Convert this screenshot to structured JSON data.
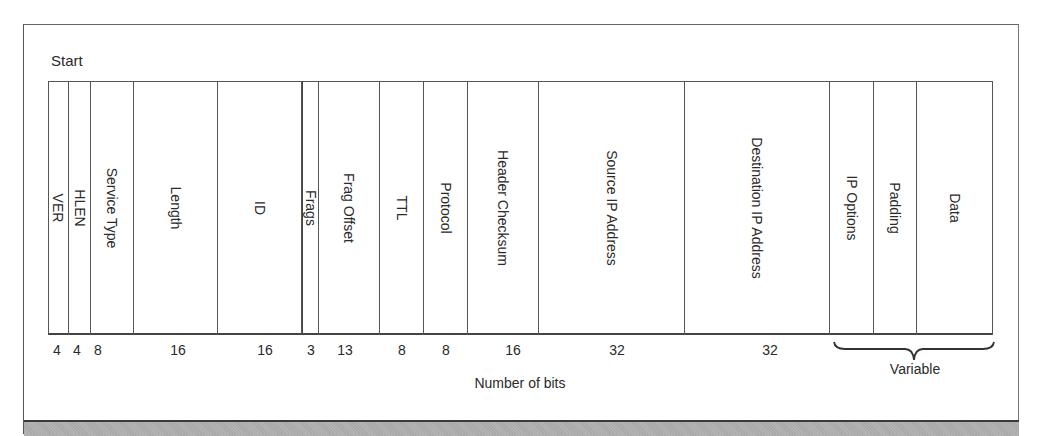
{
  "diagram": {
    "start_label": "Start",
    "axis_label": "Number of bits",
    "variable_label": "Variable",
    "fields": [
      {
        "label": "VER",
        "bits": "4",
        "x0": 48,
        "x1": 69
      },
      {
        "label": "HLEN",
        "bits": "4",
        "x0": 69,
        "x1": 91
      },
      {
        "label": "Service Type",
        "bits": "8",
        "x0": 91,
        "x1": 134
      },
      {
        "label": "Length",
        "bits": "16",
        "x0": 134,
        "x1": 218
      },
      {
        "label": "ID",
        "bits": "16",
        "x0": 218,
        "x1": 302
      },
      {
        "label": "Frags",
        "bits": "3",
        "x0": 302,
        "x1": 319
      },
      {
        "label": "Frag Offset",
        "bits": "13",
        "x0": 319,
        "x1": 380
      },
      {
        "label": "TTL",
        "bits": "8",
        "x0": 380,
        "x1": 424
      },
      {
        "label": "Protocol",
        "bits": "8",
        "x0": 424,
        "x1": 468
      },
      {
        "label": "Header Checksum",
        "bits": "16",
        "x0": 468,
        "x1": 539
      },
      {
        "label": "Source IP Address",
        "bits": "32",
        "x0": 539,
        "x1": 685
      },
      {
        "label": "Destination IP Address",
        "bits": "32",
        "x0": 685,
        "x1": 830
      },
      {
        "label": "IP Options",
        "bits": "",
        "x0": 830,
        "x1": 874
      },
      {
        "label": "Padding",
        "bits": "",
        "x0": 874,
        "x1": 917
      },
      {
        "label": "Data",
        "bits": "",
        "x0": 917,
        "x1": 993
      }
    ],
    "bit_labels": [
      {
        "text": "4",
        "x": 57
      },
      {
        "text": "4",
        "x": 77
      },
      {
        "text": "8",
        "x": 98
      },
      {
        "text": "16",
        "x": 178
      },
      {
        "text": "16",
        "x": 265
      },
      {
        "text": "3",
        "x": 311
      },
      {
        "text": "13",
        "x": 345
      },
      {
        "text": "8",
        "x": 402
      },
      {
        "text": "8",
        "x": 446
      },
      {
        "text": "16",
        "x": 513
      },
      {
        "text": "32",
        "x": 617
      },
      {
        "text": "32",
        "x": 770
      }
    ]
  }
}
